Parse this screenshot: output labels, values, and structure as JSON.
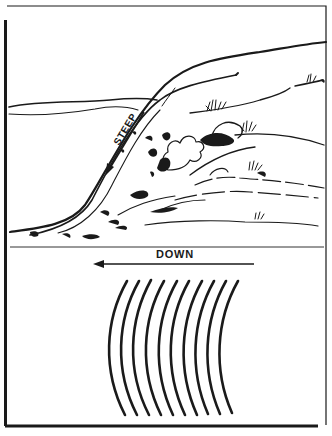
{
  "figure": {
    "top_panel": {
      "description": "Sketch of a steep hillside slope with rocks, bushes and grass",
      "slope_label": "STEEP"
    },
    "bottom_panel": {
      "description": "Contour-line representation of a steep slope",
      "direction_label": "DOWN",
      "contour_count": 10
    },
    "colors": {
      "ink": "#1a1a1a",
      "paper": "#ffffff"
    }
  }
}
